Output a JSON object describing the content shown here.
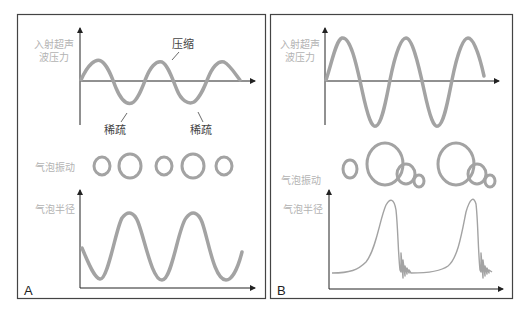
{
  "panels": [
    {
      "letter": "A",
      "top_ylabel_line1": "入射超声",
      "top_ylabel_line2": "波压力",
      "annotation_compression": "压缩",
      "annotation_rarefaction_1": "稀疏",
      "annotation_rarefaction_2": "稀疏",
      "bubble_label": "气泡振动",
      "bottom_ylabel": "气泡半径",
      "description": "Stable cavitation: low-amplitude pressure wave, bubbles oscillate regularly in size, radius varies sinusoidally"
    },
    {
      "letter": "B",
      "top_ylabel_line1": "入射超声",
      "top_ylabel_line2": "波压力",
      "bubble_label": "气泡振动",
      "bottom_ylabel": "气泡半径",
      "description": "Inertial cavitation: high-amplitude pressure wave, bubbles grow then collapse into smaller bubbles, radius spikes then rings down"
    }
  ],
  "colors": {
    "curve": "#a3a3a3",
    "axis": "#222222",
    "border": "#444444",
    "label": "#b3b3b3"
  }
}
